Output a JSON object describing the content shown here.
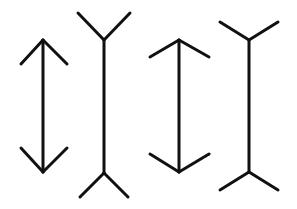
{
  "diagram": {
    "type": "muller-lyer-illusion",
    "background": "#ffffff",
    "line_color": "#111111",
    "figures": [
      {
        "name": "arrow-inward-fins-1",
        "shaft": [
          43,
          40,
          43,
          172
        ],
        "segments": [
          [
            43,
            40,
            21,
            64
          ],
          [
            43,
            40,
            67,
            64
          ],
          [
            43,
            172,
            21,
            148
          ],
          [
            43,
            172,
            67,
            148
          ]
        ]
      },
      {
        "name": "arrow-outward-fins-1",
        "shaft": [
          104,
          40,
          104,
          173
        ],
        "segments": [
          [
            104,
            40,
            78,
            13
          ],
          [
            104,
            40,
            130,
            13
          ],
          [
            104,
            173,
            80,
            197
          ],
          [
            104,
            173,
            128,
            197
          ]
        ]
      },
      {
        "name": "arrow-inward-fins-2",
        "shaft": [
          179,
          40,
          179,
          172
        ],
        "segments": [
          [
            179,
            40,
            150,
            57
          ],
          [
            179,
            40,
            209,
            57
          ],
          [
            179,
            172,
            150,
            154
          ],
          [
            179,
            172,
            209,
            154
          ]
        ]
      },
      {
        "name": "arrow-outward-fins-2",
        "shaft": [
          249,
          40,
          249,
          172
        ],
        "segments": [
          [
            249,
            40,
            220,
            22
          ],
          [
            249,
            40,
            278,
            22
          ],
          [
            249,
            172,
            220,
            190
          ],
          [
            249,
            172,
            278,
            190
          ]
        ]
      }
    ]
  }
}
